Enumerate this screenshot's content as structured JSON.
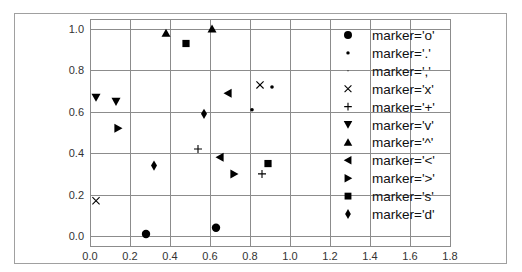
{
  "chart_data": {
    "type": "scatter",
    "title": "",
    "xlabel": "",
    "ylabel": "",
    "xlim": [
      0.0,
      1.8
    ],
    "ylim": [
      -0.05,
      1.05
    ],
    "grid": true,
    "legend_position": "right inside axes",
    "x_ticks": [
      "0.0",
      "0.2",
      "0.4",
      "0.6",
      "0.8",
      "1.0",
      "1.2",
      "1.4",
      "1.6",
      "1.8"
    ],
    "y_ticks": [
      "0.0",
      "0.2",
      "0.4",
      "0.6",
      "0.8",
      "1.0"
    ],
    "series": [
      {
        "name": "marker='o'",
        "marker": "o",
        "points": [
          [
            0.28,
            0.01
          ],
          [
            0.63,
            0.04
          ]
        ]
      },
      {
        "name": "marker='.'",
        "marker": ".",
        "points": [
          [
            0.81,
            0.61
          ],
          [
            0.91,
            0.72
          ]
        ]
      },
      {
        "name": "marker=','",
        "marker": ",",
        "points": []
      },
      {
        "name": "marker='x'",
        "marker": "x",
        "points": [
          [
            0.03,
            0.17
          ],
          [
            0.85,
            0.73
          ]
        ]
      },
      {
        "name": "marker='+'",
        "marker": "+",
        "points": [
          [
            0.54,
            0.42
          ],
          [
            0.86,
            0.3
          ]
        ]
      },
      {
        "name": "marker='v'",
        "marker": "v",
        "points": [
          [
            0.03,
            0.67
          ],
          [
            0.13,
            0.65
          ]
        ]
      },
      {
        "name": "marker='^'",
        "marker": "^",
        "points": [
          [
            0.38,
            0.98
          ],
          [
            0.61,
            1.0
          ]
        ]
      },
      {
        "name": "marker='<'",
        "marker": "<",
        "points": [
          [
            0.69,
            0.69
          ],
          [
            0.65,
            0.38
          ]
        ]
      },
      {
        "name": "marker='>'",
        "marker": ">",
        "points": [
          [
            0.14,
            0.52
          ],
          [
            0.72,
            0.3
          ]
        ]
      },
      {
        "name": "marker='s'",
        "marker": "s",
        "points": [
          [
            0.48,
            0.93
          ],
          [
            0.89,
            0.35
          ]
        ]
      },
      {
        "name": "marker='d'",
        "marker": "d",
        "points": [
          [
            0.57,
            0.59
          ],
          [
            0.32,
            0.34
          ]
        ]
      }
    ],
    "colors": {
      "marker": "#000000",
      "grid": "#8c8c8c",
      "axes_frame": "#8c8c8c",
      "figure_frame": "#a0a0a0",
      "tick_label": "#333333",
      "background": "#ffffff"
    }
  }
}
